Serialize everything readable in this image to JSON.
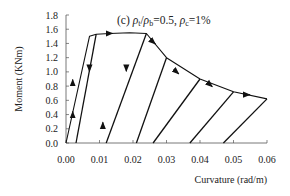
{
  "chart_data": {
    "type": "line",
    "title": "(c) ρt/ρb=0.5, ρc=1%",
    "title_parts": {
      "panel": "(c)",
      "ratio_label": "ρt/ρb",
      "ratio_value": "=0.5,",
      "rho_c_label": "ρc",
      "rho_c_value": "=1%"
    },
    "xlabel": "Curvature (rad/m)",
    "ylabel": "Moment (KNm)",
    "xlim": [
      0.0,
      0.06
    ],
    "ylim": [
      0.0,
      1.8
    ],
    "xticks": [
      "0.00",
      "0.01",
      "0.02",
      "0.03",
      "0.04",
      "0.05",
      "0.06"
    ],
    "yticks": [
      "0.0",
      "0.2",
      "0.4",
      "0.6",
      "0.8",
      "1.0",
      "1.2",
      "1.4",
      "1.6",
      "1.8"
    ],
    "grid": false,
    "legend": null,
    "series": [
      {
        "name": "loading envelope",
        "x": [
          0.0,
          0.007,
          0.009,
          0.013,
          0.019,
          0.024,
          0.03,
          0.04,
          0.05,
          0.06
        ],
        "y": [
          0.0,
          1.5,
          1.53,
          1.54,
          1.55,
          1.54,
          1.2,
          0.9,
          0.72,
          0.62
        ]
      },
      {
        "name": "unload/reload cycle 1",
        "x": [
          0.003,
          0.009
        ],
        "y": [
          0.0,
          1.53
        ]
      },
      {
        "name": "unload/reload cycle 2",
        "x": [
          0.012,
          0.024
        ],
        "y": [
          0.0,
          1.54
        ]
      },
      {
        "name": "unload/reload cycle 3",
        "x": [
          0.021,
          0.03
        ],
        "y": [
          0.0,
          1.2
        ]
      },
      {
        "name": "unload/reload cycle 4",
        "x": [
          0.026,
          0.04
        ],
        "y": [
          0.0,
          0.9
        ]
      },
      {
        "name": "unload/reload cycle 5",
        "x": [
          0.037,
          0.05
        ],
        "y": [
          0.0,
          0.72
        ]
      },
      {
        "name": "unload/reload cycle 6",
        "x": [
          0.047,
          0.06
        ],
        "y": [
          0.0,
          0.62
        ]
      }
    ],
    "annotations": [
      {
        "type": "arrow",
        "direction": "up",
        "x": 0.002,
        "y": 0.85
      },
      {
        "type": "arrow",
        "direction": "up",
        "x": 0.002,
        "y": 0.4
      },
      {
        "type": "arrow",
        "direction": "up",
        "x": 0.011,
        "y": 0.25
      },
      {
        "type": "arrow",
        "direction": "right",
        "x": 0.013,
        "y": 1.54
      },
      {
        "type": "arrow",
        "direction": "down",
        "x": 0.007,
        "y": 1.05
      },
      {
        "type": "arrow",
        "direction": "down",
        "x": 0.018,
        "y": 1.05
      },
      {
        "type": "arrow",
        "direction": "down-right",
        "x": 0.026,
        "y": 1.42
      },
      {
        "type": "arrow",
        "direction": "down-right",
        "x": 0.033,
        "y": 1.0
      },
      {
        "type": "arrow",
        "direction": "down-right",
        "x": 0.043,
        "y": 0.82
      },
      {
        "type": "arrow",
        "direction": "right",
        "x": 0.054,
        "y": 0.68
      }
    ]
  }
}
